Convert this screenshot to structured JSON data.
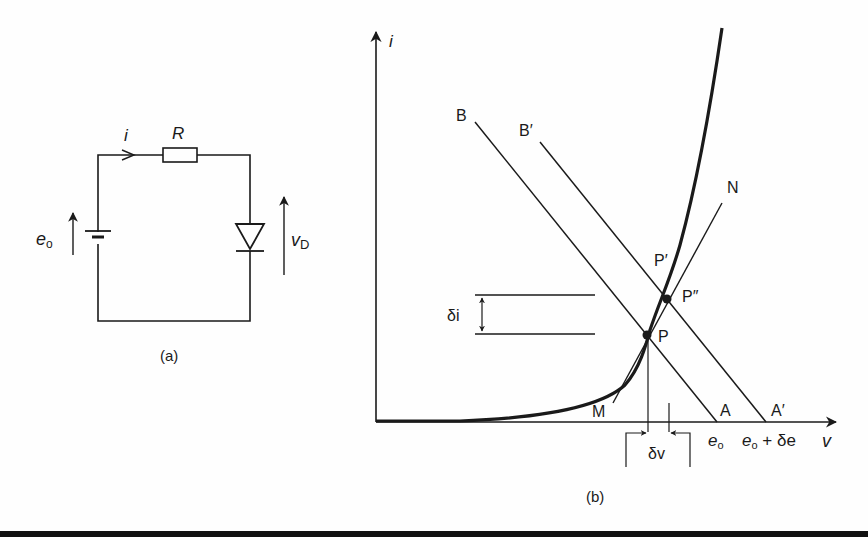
{
  "circuit": {
    "caption": "(a)",
    "current_label": "i",
    "resistor_label": "R",
    "source_label_main": "e",
    "source_label_sub": "o",
    "diode_voltage_main": "v",
    "diode_voltage_sub": "D"
  },
  "graph": {
    "caption": "(b)",
    "y_axis_label": "i",
    "x_axis_label": "v",
    "labels": {
      "B": "B",
      "B_prime": "B′",
      "N": "N",
      "P_prime": "P′",
      "P_double_prime": "P″",
      "P": "P",
      "M": "M",
      "A": "A",
      "A_prime": "A′",
      "delta_i": "δi",
      "delta_v": "δv",
      "e0_main": "e",
      "e0_sub": "o",
      "e0_plus_main": "e",
      "e0_plus_sub": "o",
      "e0_plus_rest": " + δe"
    }
  },
  "colors": {
    "ink": "#1a1a1a",
    "background": "#fefefe"
  }
}
